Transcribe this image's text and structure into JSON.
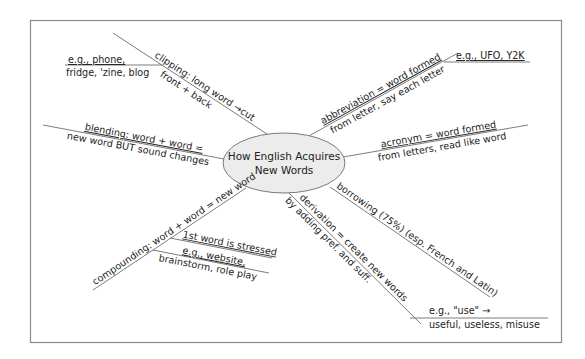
{
  "diagram": {
    "type": "mind-map",
    "center": {
      "line1": "How English Acquires",
      "line2": "New Words"
    },
    "branches": {
      "clipping": {
        "line1": "clipping: long word →cut",
        "line2": "front + back",
        "example_line1": "e.g., phone,",
        "example_line2": "fridge, 'zine, blog"
      },
      "blending": {
        "line1": "blending: word + word =",
        "line2": "new word BUT sound changes"
      },
      "compounding": {
        "line1": "compounding: word + word = new word",
        "sub1": "1st word is stressed",
        "sub2_line1": "e.g., website,",
        "sub2_line2": "brainstorm, role play"
      },
      "abbreviation": {
        "line1": "abbreviation = word formed",
        "line2": "from letter, say each letter",
        "example": "e.g., UFO, Y2K"
      },
      "acronym": {
        "line1": "acronym = word formed",
        "line2": "from letters, read like word"
      },
      "borrowing": {
        "line1": "borrowing (75%) (esp. French and Latin)"
      },
      "derivation": {
        "line1": "derivation = create new words",
        "line2": "by adding pref. and suff.",
        "example_line1": "e.g., \"use\"   →",
        "example_line2": "useful, useless, misuse"
      }
    },
    "colors": {
      "ellipse_fill": "#ececec",
      "line": "#6e6e6e",
      "text": "#222222",
      "frame": "#8a8a8a"
    }
  }
}
